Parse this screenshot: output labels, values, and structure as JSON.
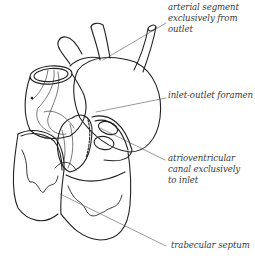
{
  "figure": {
    "stroke_color": "#222222",
    "leader_color": "#555555",
    "text_color": "#3a3a3a"
  },
  "labels": {
    "arterial_segment": {
      "lines": [
        "arterial segment",
        "exclusively from",
        "outlet"
      ]
    },
    "inlet_outlet_foramen": {
      "lines": [
        "inlet-outlet foramen"
      ]
    },
    "atrioventricular_canal": {
      "lines": [
        "atrioventricular",
        "canal exclusively",
        "to inlet"
      ]
    },
    "trabecular_septum": {
      "lines": [
        "trabecular septum"
      ]
    }
  }
}
